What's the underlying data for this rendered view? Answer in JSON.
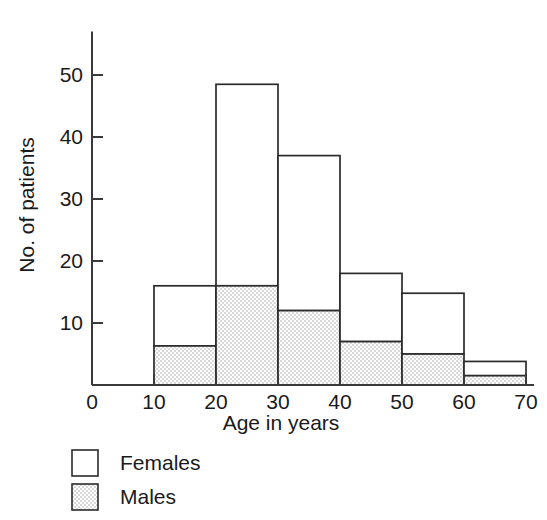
{
  "chart_data": {
    "type": "bar",
    "title": "",
    "subtitle": "",
    "xlabel": "Age in years",
    "ylabel": "No. of patients",
    "stacked": true,
    "grid": false,
    "legend_position": "below-left",
    "bin_width": 10,
    "categories": [
      "10-20",
      "20-30",
      "30-40",
      "40-50",
      "50-60",
      "60-70"
    ],
    "bin_edges": [
      10,
      20,
      30,
      40,
      50,
      60,
      70
    ],
    "xlim": [
      0,
      70
    ],
    "ylim": [
      0,
      57
    ],
    "xticks": [
      "0",
      "10",
      "20",
      "30",
      "40",
      "50",
      "60",
      "70"
    ],
    "xtick_values": [
      0,
      10,
      20,
      30,
      40,
      50,
      60,
      70
    ],
    "yticks": [
      "10",
      "20",
      "30",
      "40",
      "50"
    ],
    "ytick_values": [
      10,
      20,
      30,
      40,
      50
    ],
    "series": [
      {
        "name": "Males",
        "fill": "stipple-grey",
        "color": "#e2e2e2",
        "values": [
          6.3,
          16.0,
          12.0,
          7.0,
          5.0,
          1.5
        ]
      },
      {
        "name": "Females",
        "fill": "white",
        "color": "#ffffff",
        "values": [
          9.7,
          32.5,
          25.0,
          11.0,
          9.8,
          2.3
        ]
      }
    ],
    "totals": [
      16.0,
      48.5,
      37.0,
      18.0,
      14.8,
      3.8
    ]
  },
  "legend": {
    "entries": [
      {
        "label": "Females",
        "swatch": "white"
      },
      {
        "label": "Males",
        "swatch": "stipple-grey"
      }
    ]
  },
  "colors": {
    "ink": "#1a1a1a",
    "axis": "#3a3a3a",
    "bar_outline": "#2b2b2b",
    "male_fill": "#e2e2e2",
    "female_fill": "#ffffff",
    "background": "#ffffff"
  }
}
